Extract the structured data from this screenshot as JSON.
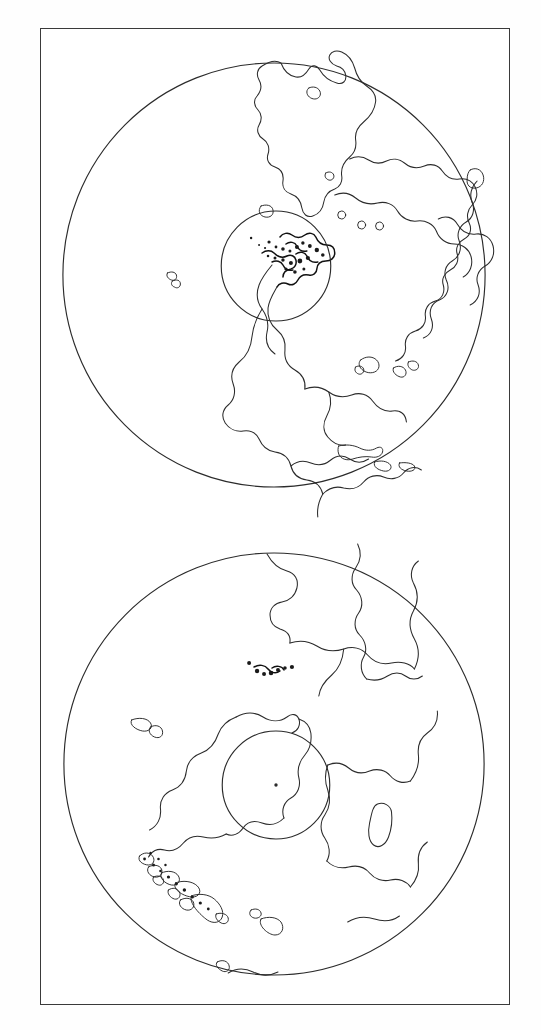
{
  "figure": {
    "background_color": "#ffffff",
    "frame_color": "#3a3a3a",
    "line_color": "#2b2b2b",
    "width": 541,
    "height": 1030
  },
  "chart_data": {
    "type": "map",
    "projection": "orthographic",
    "grid": false,
    "legend": null,
    "panels": [
      {
        "name": "north-atlantic-globe",
        "label": "Upper globe",
        "limb": {
          "cx": 234,
          "cy": 246,
          "r": 212
        },
        "inner_circle": {
          "cx": 236,
          "cy": 237,
          "r": 55
        },
        "center_marker": null,
        "landmasses": [
          "Greenland",
          "Scandinavia",
          "Northern Europe",
          "Canadian Arctic Archipelago",
          "Hudson Bay",
          "North America",
          "Central America",
          "Caribbean Islands",
          "Northern South America",
          "Iceland",
          "Western Africa edge"
        ]
      },
      {
        "name": "south-atlantic-globe",
        "label": "Lower globe",
        "limb": {
          "cx": 234,
          "cy": 243,
          "r": 211
        },
        "inner_circle": {
          "cx": 236,
          "cy": 264,
          "r": 54
        },
        "center_marker": {
          "cx": 236,
          "cy": 264
        },
        "landmasses": [
          "South America",
          "Africa",
          "Madagascar",
          "Antarctic Peninsula",
          "Tierra del Fuego",
          "Chilean Archipelago",
          "Falkland Islands",
          "Atlantic Islands"
        ]
      }
    ]
  }
}
